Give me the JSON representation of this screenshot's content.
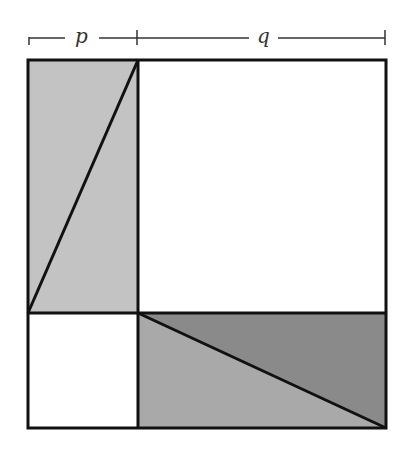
{
  "diagram": {
    "labels": {
      "p": "p",
      "q": "q"
    },
    "colors": {
      "light_gray": "#c3c3c3",
      "medium_gray": "#a9a9a9",
      "dark_gray": "#8a8a8a",
      "stroke": "#111111"
    }
  }
}
